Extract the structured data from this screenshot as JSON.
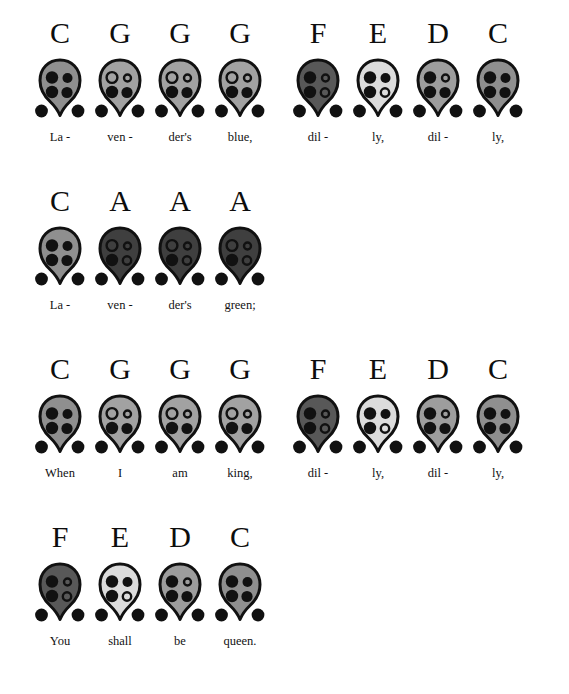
{
  "sheet": {
    "title": "Lavender's Blue — ocarina fingering chart",
    "instrument": "4-hole ocarina",
    "palette": {
      "outline": "#111111",
      "hole_filled": "#111111",
      "hole_open_fill": "none",
      "body_dark": "#4a4a4a",
      "body_mid": "#9a9a9a",
      "body_light": "#d9d9d9",
      "background": "#ffffff",
      "text": "#111111"
    },
    "fingering_legend": {
      "filled": "covered hole",
      "open": "uncovered hole",
      "thumbs": "two lower thumb holes, always covered"
    }
  },
  "fingerings": {
    "C": {
      "note": "C",
      "body_shade": "#8f8f8f",
      "holes": {
        "top_left": "filled",
        "top_right": "filled",
        "bottom_left": "filled",
        "bottom_right": "filled"
      },
      "thumbs": {
        "left": "filled",
        "right": "filled"
      }
    },
    "D": {
      "note": "D",
      "body_shade": "#9d9d9d",
      "holes": {
        "top_left": "filled",
        "top_right": "open",
        "bottom_left": "filled",
        "bottom_right": "filled"
      },
      "thumbs": {
        "left": "filled",
        "right": "filled"
      }
    },
    "E": {
      "note": "E",
      "body_shade": "#dcdcdc",
      "holes": {
        "top_left": "filled",
        "top_right": "filled",
        "bottom_left": "filled",
        "bottom_right": "open"
      },
      "thumbs": {
        "left": "filled",
        "right": "filled"
      }
    },
    "F": {
      "note": "F",
      "body_shade": "#585858",
      "holes": {
        "top_left": "filled",
        "top_right": "open",
        "bottom_left": "filled",
        "bottom_right": "open"
      },
      "thumbs": {
        "left": "filled",
        "right": "filled"
      }
    },
    "G": {
      "note": "G",
      "body_shade": "#a2a2a2",
      "holes": {
        "top_left": "open",
        "top_right": "open",
        "bottom_left": "filled",
        "bottom_right": "filled"
      },
      "thumbs": {
        "left": "filled",
        "right": "filled"
      }
    },
    "A": {
      "note": "A",
      "body_shade": "#3f3f3f",
      "holes": {
        "top_left": "open",
        "top_right": "open",
        "bottom_left": "filled",
        "bottom_right": "open"
      },
      "thumbs": {
        "left": "filled",
        "right": "filled"
      }
    }
  },
  "rows": [
    {
      "row_index": 1,
      "top": 18,
      "groups": [
        {
          "left": 30,
          "notes": [
            {
              "note": "C",
              "lyric": "La -"
            },
            {
              "note": "G",
              "lyric": "ven -"
            },
            {
              "note": "G",
              "lyric": "der's"
            },
            {
              "note": "G",
              "lyric": "blue,"
            }
          ]
        },
        {
          "left": 288,
          "notes": [
            {
              "note": "F",
              "lyric": "dil -"
            },
            {
              "note": "E",
              "lyric": "ly,"
            },
            {
              "note": "D",
              "lyric": "dil -"
            },
            {
              "note": "C",
              "lyric": "ly,"
            }
          ]
        }
      ]
    },
    {
      "row_index": 2,
      "top": 186,
      "groups": [
        {
          "left": 30,
          "notes": [
            {
              "note": "C",
              "lyric": "La -"
            },
            {
              "note": "A",
              "lyric": "ven -"
            },
            {
              "note": "A",
              "lyric": "der's"
            },
            {
              "note": "A",
              "lyric": "green;"
            }
          ]
        }
      ]
    },
    {
      "row_index": 3,
      "top": 354,
      "groups": [
        {
          "left": 30,
          "notes": [
            {
              "note": "C",
              "lyric": "When"
            },
            {
              "note": "G",
              "lyric": "I"
            },
            {
              "note": "G",
              "lyric": "am"
            },
            {
              "note": "G",
              "lyric": "king,"
            }
          ]
        },
        {
          "left": 288,
          "notes": [
            {
              "note": "F",
              "lyric": "dil -"
            },
            {
              "note": "E",
              "lyric": "ly,"
            },
            {
              "note": "D",
              "lyric": "dil -"
            },
            {
              "note": "C",
              "lyric": "ly,"
            }
          ]
        }
      ]
    },
    {
      "row_index": 4,
      "top": 522,
      "groups": [
        {
          "left": 30,
          "notes": [
            {
              "note": "F",
              "lyric": "You"
            },
            {
              "note": "E",
              "lyric": "shall"
            },
            {
              "note": "D",
              "lyric": "be"
            },
            {
              "note": "C",
              "lyric": "queen."
            }
          ]
        }
      ]
    }
  ]
}
